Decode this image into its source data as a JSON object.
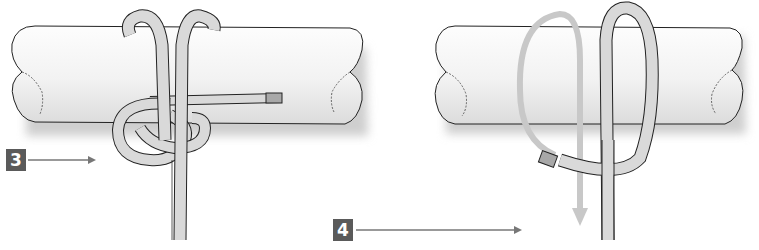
{
  "diagram": {
    "type": "knot-tying-steps",
    "steps": [
      {
        "number": "3",
        "label": "3"
      },
      {
        "number": "4",
        "label": "4"
      }
    ],
    "colors": {
      "pole_fill": "#f3f3f3",
      "pole_shadow": "#cfcfcf",
      "rope_fill": "#d9d9d9",
      "rope_end": "#a8a8a8",
      "outline": "#222222",
      "badge_bg": "#5a5a5a",
      "badge_text": "#ffffff",
      "arrow_line": "#777777",
      "motion_arrow": "#c8c8c8"
    }
  }
}
